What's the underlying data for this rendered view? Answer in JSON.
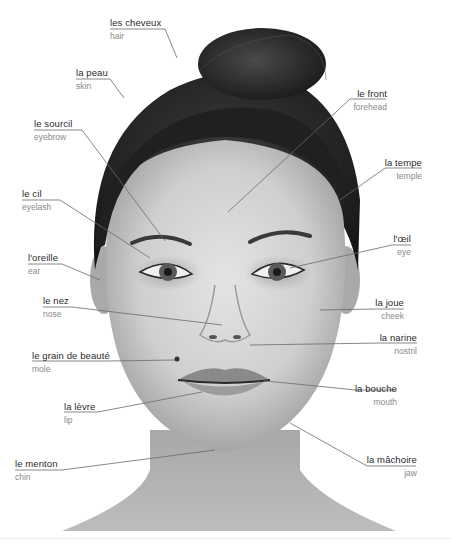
{
  "diagram": {
    "colors": {
      "background": "#ffffff",
      "french_text": "#2a2a2a",
      "english_text": "#8a8a8a",
      "leader_line": "#6a6a6a"
    },
    "labels": [
      {
        "id": "hair",
        "fr": "les cheveux",
        "en": "hair",
        "side": "left"
      },
      {
        "id": "skin",
        "fr": "la peau",
        "en": "skin",
        "side": "left"
      },
      {
        "id": "forehead",
        "fr": "le front",
        "en": "forehead",
        "side": "right"
      },
      {
        "id": "eyebrow",
        "fr": "le sourcil",
        "en": "eyebrow",
        "side": "left"
      },
      {
        "id": "temple",
        "fr": "la tempe",
        "en": "temple",
        "side": "right"
      },
      {
        "id": "eyelash",
        "fr": "le cil",
        "en": "eyelash",
        "side": "left"
      },
      {
        "id": "eye",
        "fr": "l'œil",
        "en": "eye",
        "side": "right"
      },
      {
        "id": "ear",
        "fr": "l'oreille",
        "en": "ear",
        "side": "left"
      },
      {
        "id": "nose",
        "fr": "le nez",
        "en": "nose",
        "side": "left"
      },
      {
        "id": "cheek",
        "fr": "la joue",
        "en": "cheek",
        "side": "right"
      },
      {
        "id": "nostril",
        "fr": "la narine",
        "en": "nostril",
        "side": "right"
      },
      {
        "id": "mole",
        "fr": "le grain de beauté",
        "en": "mole",
        "side": "left"
      },
      {
        "id": "mouth",
        "fr": "la bouche",
        "en": "mouth",
        "side": "right"
      },
      {
        "id": "lip",
        "fr": "la lèvre",
        "en": "lip",
        "side": "left"
      },
      {
        "id": "jaw",
        "fr": "la mâchoire",
        "en": "jaw",
        "side": "right"
      },
      {
        "id": "chin",
        "fr": "le menton",
        "en": "chin",
        "side": "left"
      }
    ],
    "image": {
      "subject": "portrait-of-woman-face",
      "style": "grayscale-photo"
    }
  }
}
